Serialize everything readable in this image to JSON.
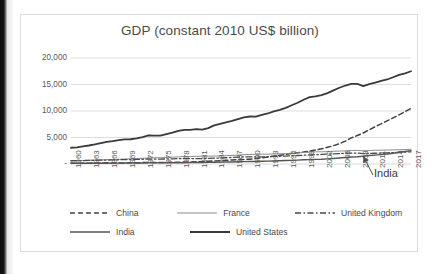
{
  "chart_data": {
    "type": "line",
    "title": "GDP (constant 2010 US$ billion)",
    "xlabel": "",
    "ylabel": "",
    "ylim": [
      0,
      20000
    ],
    "yticks": [
      "-",
      "5,000",
      "10,000",
      "15,000",
      "20,000"
    ],
    "ytick_values": [
      0,
      5000,
      10000,
      15000,
      20000
    ],
    "grid": true,
    "legend_position": "bottom",
    "x": [
      1960,
      1961,
      1962,
      1963,
      1964,
      1965,
      1966,
      1967,
      1968,
      1969,
      1970,
      1971,
      1972,
      1973,
      1974,
      1975,
      1976,
      1977,
      1978,
      1979,
      1980,
      1981,
      1982,
      1983,
      1984,
      1985,
      1986,
      1987,
      1988,
      1989,
      1990,
      1991,
      1992,
      1993,
      1994,
      1995,
      1996,
      1997,
      1998,
      1999,
      2000,
      2001,
      2002,
      2003,
      2004,
      2005,
      2006,
      2007,
      2008,
      2009,
      2010,
      2011,
      2012,
      2013,
      2014,
      2015,
      2016,
      2017
    ],
    "xtick_labels": [
      "1960",
      "1963",
      "1966",
      "1969",
      "1972",
      "1975",
      "1978",
      "1981",
      "1984",
      "1987",
      "1990",
      "1993",
      "1996",
      "1999",
      "2002",
      "2005",
      "2008",
      "2011",
      "2014",
      "2017"
    ],
    "series": [
      {
        "name": "China",
        "style": "dashed",
        "color": "#404040",
        "width": 1.5,
        "values": [
          190,
          150,
          140,
          155,
          180,
          205,
          220,
          210,
          195,
          215,
          250,
          265,
          270,
          290,
          295,
          310,
          300,
          325,
          360,
          390,
          420,
          445,
          490,
          540,
          605,
          680,
          740,
          820,
          910,
          945,
          975,
          1115,
          1275,
          1450,
          1640,
          1820,
          2000,
          2190,
          2360,
          2530,
          2740,
          2970,
          3240,
          3570,
          3930,
          4380,
          4940,
          5650,
          6190,
          6760,
          7480,
          8190,
          8830,
          9520,
          10220,
          10920,
          11670,
          12440
        ],
        "values_note": "rises steeply after 2002, ends near 10,500 on the plotted scale",
        "end_value": 10500
      },
      {
        "name": "France",
        "style": "solid-thin",
        "color": "#8c8c8c",
        "width": 1,
        "values": [
          620,
          640,
          680,
          710,
          750,
          780,
          820,
          850,
          890,
          950,
          990,
          1040,
          1080,
          1140,
          1180,
          1190,
          1250,
          1300,
          1350,
          1400,
          1420,
          1440,
          1470,
          1480,
          1500,
          1530,
          1570,
          1610,
          1690,
          1760,
          1810,
          1830,
          1860,
          1850,
          1890,
          1930,
          1960,
          2030,
          2100,
          2170,
          2250,
          2290,
          2310,
          2330,
          2400,
          2430,
          2490,
          2550,
          2570,
          2490,
          2540,
          2600,
          2610,
          2630,
          2660,
          2690,
          2720,
          2780
        ]
      },
      {
        "name": "United Kingdom",
        "style": "dash-dot",
        "color": "#4a4a4a",
        "width": 1.3,
        "values": [
          610,
          630,
          640,
          670,
          700,
          720,
          740,
          760,
          800,
          820,
          840,
          860,
          900,
          940,
          930,
          920,
          950,
          980,
          1010,
          1040,
          1020,
          1000,
          1020,
          1060,
          1090,
          1140,
          1180,
          1240,
          1310,
          1340,
          1350,
          1330,
          1330,
          1360,
          1420,
          1460,
          1500,
          1540,
          1600,
          1650,
          1720,
          1760,
          1800,
          1860,
          1910,
          1970,
          2020,
          2070,
          2050,
          1960,
          2000,
          2030,
          2060,
          2100,
          2160,
          2210,
          2250,
          2290
        ]
      },
      {
        "name": "India",
        "style": "solid-medium",
        "color": "#555555",
        "width": 1.4,
        "values": [
          120,
          125,
          130,
          140,
          150,
          145,
          150,
          165,
          170,
          180,
          195,
          195,
          195,
          210,
          210,
          225,
          230,
          250,
          265,
          245,
          265,
          285,
          295,
          320,
          335,
          355,
          375,
          390,
          430,
          455,
          480,
          485,
          510,
          540,
          575,
          615,
          655,
          685,
          730,
          790,
          820,
          865,
          900,
          970,
          1050,
          1130,
          1220,
          1320,
          1360,
          1470,
          1590,
          1680,
          1770,
          1880,
          2020,
          2180,
          2350,
          2520
        ]
      },
      {
        "name": "United States",
        "style": "solid-thick",
        "color": "#3a3a3a",
        "width": 1.8,
        "values": [
          3070,
          3150,
          3340,
          3480,
          3680,
          3920,
          4170,
          4280,
          4480,
          4620,
          4630,
          4780,
          5030,
          5320,
          5290,
          5280,
          5570,
          5820,
          6140,
          6340,
          6320,
          6480,
          6360,
          6650,
          7130,
          7430,
          7690,
          7950,
          8280,
          8580,
          8740,
          8720,
          9020,
          9270,
          9650,
          9900,
          10280,
          10740,
          11200,
          11740,
          12210,
          12320,
          12550,
          12900,
          13400,
          13860,
          14250,
          14550,
          14510,
          14100,
          14450,
          14700,
          15000,
          15260,
          15650,
          16060,
          16320,
          16690
        ],
        "end_value": 17500
      }
    ],
    "annotations": [
      {
        "text": "India",
        "points_to_series": "India",
        "points_to_year": 2009,
        "arrow": true
      }
    ]
  },
  "legend": {
    "row1": [
      {
        "label": "China",
        "style": "dashed"
      },
      {
        "label": "France",
        "style": "solid-thin"
      },
      {
        "label": "United Kingdom",
        "style": "dash-dot"
      }
    ],
    "row2": [
      {
        "label": "India",
        "style": "solid-medium"
      },
      {
        "label": "United States",
        "style": "solid-thick"
      }
    ]
  }
}
